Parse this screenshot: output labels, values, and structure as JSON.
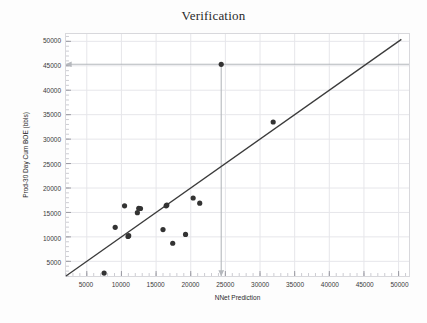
{
  "chart_data": {
    "type": "scatter",
    "title": "Verification",
    "xlabel": "NNet Prediction",
    "ylabel": "Prod-30 Day Cum BOE (bbls)",
    "xlim": [
      2000,
      51500
    ],
    "ylim": [
      2000,
      51500
    ],
    "grid": true,
    "legend": null,
    "xticks": [
      5000,
      10000,
      15000,
      20000,
      25000,
      30000,
      35000,
      40000,
      45000,
      50000
    ],
    "yticks": [
      5000,
      10000,
      15000,
      20000,
      25000,
      30000,
      35000,
      40000,
      45000,
      50000
    ],
    "xtick_labels": [
      "5000",
      "10000",
      "15000",
      "20000",
      "25000",
      "30000",
      "35000",
      "40000",
      "45000",
      "50000"
    ],
    "ytick_labels": [
      "5000",
      "10000",
      "15000",
      "20000",
      "25000",
      "30000",
      "35000",
      "40000",
      "45000",
      "50000"
    ],
    "minor_ticks_per_interval": 5,
    "series": [
      {
        "name": "wells",
        "marker": "circle",
        "color": "#333333",
        "points": [
          {
            "x": 7500,
            "y": 2600
          },
          {
            "x": 9100,
            "y": 11950
          },
          {
            "x": 10450,
            "y": 16350
          },
          {
            "x": 10950,
            "y": 10100
          },
          {
            "x": 11050,
            "y": 10250
          },
          {
            "x": 12300,
            "y": 14950
          },
          {
            "x": 12750,
            "y": 15800
          },
          {
            "x": 12500,
            "y": 15850
          },
          {
            "x": 16000,
            "y": 11500
          },
          {
            "x": 16450,
            "y": 16350
          },
          {
            "x": 16550,
            "y": 16500
          },
          {
            "x": 17400,
            "y": 8700
          },
          {
            "x": 19250,
            "y": 10500
          },
          {
            "x": 20350,
            "y": 17950
          },
          {
            "x": 21300,
            "y": 16900
          },
          {
            "x": 24400,
            "y": 45300
          },
          {
            "x": 31900,
            "y": 33500
          }
        ]
      }
    ],
    "reference_line": {
      "name": "one-to-one-line",
      "color": "#3b3b3b",
      "from": {
        "x": 2000,
        "y": 2000
      },
      "to": {
        "x": 50400,
        "y": 50400
      }
    },
    "annotations": [
      {
        "name": "crosshair-horizontal-arrow",
        "type": "arrow",
        "color": "#b5b8bd",
        "from": {
          "x": 51500,
          "y": 45300
        },
        "to": {
          "x": 2000,
          "y": 45300
        },
        "label": "45000"
      },
      {
        "name": "crosshair-vertical-arrow",
        "type": "arrow",
        "color": "#b5b8bd",
        "from": {
          "x": 24400,
          "y": 45300
        },
        "to": {
          "x": 24400,
          "y": 2000
        },
        "label": "25000"
      }
    ]
  }
}
